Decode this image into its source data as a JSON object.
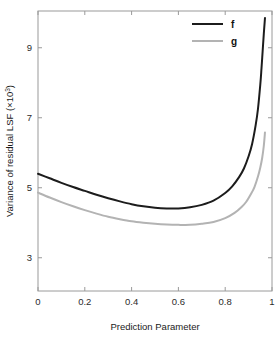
{
  "chart_data": {
    "type": "line",
    "title": "",
    "xlabel": "Prediction Parameter",
    "ylabel": "Variance of residual LSF (×10³)",
    "ylabel_base": "Variance of residual LSF (×10",
    "ylabel_exponent": "3",
    "ylabel_close": ")",
    "xlim": [
      0,
      1
    ],
    "ylim": [
      2.05,
      10.05
    ],
    "grid": false,
    "legend_position": "top-right",
    "xticks": [
      0,
      0.2,
      0.4,
      0.6,
      0.8,
      1
    ],
    "xticklabels": [
      "0",
      "0.2",
      "0.4",
      "0.6",
      "0.8",
      "1"
    ],
    "yticks": [
      3,
      5,
      7,
      9
    ],
    "yticklabels": [
      "3",
      "5",
      "7",
      "9"
    ],
    "series": [
      {
        "name": "f",
        "color": "#1c1c1c",
        "width": 2.0,
        "x": [
          0.0,
          0.05,
          0.1,
          0.15,
          0.2,
          0.25,
          0.3,
          0.35,
          0.4,
          0.45,
          0.5,
          0.55,
          0.6,
          0.65,
          0.7,
          0.75,
          0.8,
          0.83,
          0.86,
          0.88,
          0.9,
          0.915,
          0.93,
          0.94,
          0.95,
          0.955,
          0.96,
          0.965,
          0.97
        ],
        "values": [
          5.4,
          5.27,
          5.14,
          5.02,
          4.91,
          4.8,
          4.7,
          4.61,
          4.53,
          4.47,
          4.43,
          4.41,
          4.41,
          4.44,
          4.51,
          4.63,
          4.85,
          5.04,
          5.31,
          5.55,
          5.9,
          6.25,
          6.78,
          7.25,
          7.95,
          8.4,
          8.9,
          9.4,
          9.85
        ]
      },
      {
        "name": "g",
        "color": "#b3b3b3",
        "width": 2.0,
        "x": [
          0.0,
          0.05,
          0.1,
          0.15,
          0.2,
          0.25,
          0.3,
          0.35,
          0.4,
          0.45,
          0.5,
          0.55,
          0.6,
          0.65,
          0.7,
          0.75,
          0.8,
          0.84,
          0.87,
          0.89,
          0.91,
          0.925,
          0.94,
          0.95,
          0.958,
          0.965,
          0.97
        ],
        "values": [
          4.86,
          4.72,
          4.59,
          4.47,
          4.36,
          4.26,
          4.17,
          4.1,
          4.04,
          4.0,
          3.97,
          3.95,
          3.94,
          3.94,
          3.97,
          4.02,
          4.13,
          4.28,
          4.45,
          4.6,
          4.82,
          5.02,
          5.32,
          5.58,
          5.85,
          6.2,
          6.58
        ]
      }
    ],
    "legend": [
      {
        "label": "f",
        "color": "#1c1c1c"
      },
      {
        "label": "g",
        "color": "#b3b3b3"
      }
    ],
    "axis_color": "#9a9a9a",
    "background": "#ffffff"
  },
  "layout": {
    "plot_left": 38,
    "plot_right": 272,
    "plot_top": 11,
    "plot_bottom": 291
  }
}
